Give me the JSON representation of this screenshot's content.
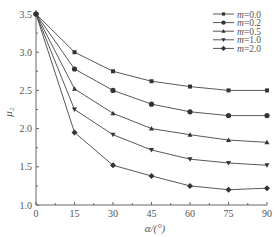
{
  "chart_data": {
    "type": "line",
    "title": "",
    "xlabel": "α/(°)",
    "ylabel": "μ₂",
    "xlim": [
      0,
      90
    ],
    "ylim": [
      1.0,
      3.5
    ],
    "x_ticks": [
      0,
      15,
      30,
      45,
      60,
      75,
      90
    ],
    "y_ticks": [
      1.0,
      1.5,
      2.0,
      2.5,
      3.0,
      3.5
    ],
    "x": [
      0,
      15,
      30,
      45,
      60,
      75,
      90
    ],
    "legend_position": "upper right",
    "grid": false,
    "series": [
      {
        "name": "m=0.0",
        "marker": "square",
        "values": [
          3.5,
          3.0,
          2.75,
          2.62,
          2.55,
          2.5,
          2.5
        ]
      },
      {
        "name": "m=0.2",
        "marker": "circle",
        "values": [
          3.5,
          2.78,
          2.5,
          2.32,
          2.22,
          2.17,
          2.17
        ]
      },
      {
        "name": "m=0.5",
        "marker": "triangle-up",
        "values": [
          3.5,
          2.52,
          2.2,
          2.0,
          1.92,
          1.85,
          1.82
        ]
      },
      {
        "name": "m=1.0",
        "marker": "triangle-down",
        "values": [
          3.5,
          2.25,
          1.92,
          1.72,
          1.6,
          1.55,
          1.52
        ]
      },
      {
        "name": "m=2.0",
        "marker": "diamond",
        "values": [
          3.5,
          1.95,
          1.52,
          1.38,
          1.25,
          1.2,
          1.22
        ]
      }
    ]
  }
}
